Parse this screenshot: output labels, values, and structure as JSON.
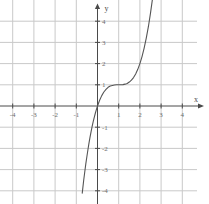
{
  "chart_data": {
    "type": "line",
    "title": "",
    "subtitle": "",
    "xlabel": "x",
    "ylabel": "y",
    "xlim": [
      -4.6,
      4.6
    ],
    "ylim": [
      -4.6,
      4.6
    ],
    "grid": true,
    "legend": null,
    "legend_position": "none",
    "x_ticks": [
      -4,
      -3,
      -2,
      -1,
      1,
      2,
      3,
      4
    ],
    "x_tick_labels": [
      "-4",
      "-3",
      "-2",
      "-1",
      "1",
      "2",
      "3",
      "4"
    ],
    "y_ticks": [
      4,
      3,
      2,
      1,
      -1,
      -2,
      -3,
      -4
    ],
    "y_tick_labels": [
      "4",
      "3",
      "2",
      "1",
      "-1",
      "-2",
      "-3",
      "-4"
    ],
    "series": [
      {
        "name": "y = (x - 1)^3 + 1",
        "curve_color": "#555555",
        "x": [
          -0.72,
          -0.65,
          -0.6,
          -0.55,
          -0.5,
          -0.45,
          -0.4,
          -0.35,
          -0.3,
          -0.25,
          -0.2,
          -0.15,
          -0.1,
          -0.05,
          0,
          0.1,
          0.2,
          0.3,
          0.4,
          0.5,
          0.6,
          0.7,
          0.8,
          0.9,
          1,
          1.1,
          1.2,
          1.3,
          1.4,
          1.5,
          1.6,
          1.7,
          1.8,
          1.9,
          2,
          2.1,
          2.2,
          2.3,
          2.4,
          2.5,
          2.6
        ],
        "y": [
          -4.11,
          -3.49,
          -3.1,
          -2.72,
          -2.38,
          -2.05,
          -1.74,
          -1.46,
          -1.2,
          -0.95,
          -0.73,
          -0.52,
          -0.33,
          -0.16,
          0,
          0.27,
          0.49,
          0.66,
          0.78,
          0.88,
          0.94,
          0.97,
          0.99,
          1.0,
          1.0,
          1.0,
          1.01,
          1.03,
          1.06,
          1.13,
          1.22,
          1.34,
          1.51,
          1.73,
          2.0,
          2.33,
          2.73,
          3.2,
          3.74,
          4.38,
          5.1
        ]
      }
    ],
    "axis_color": "#4a4a4a",
    "grid_color": "#c9c9c9",
    "annotations": []
  },
  "axes": {
    "x_axis_label": "x",
    "y_axis_label": "y"
  }
}
